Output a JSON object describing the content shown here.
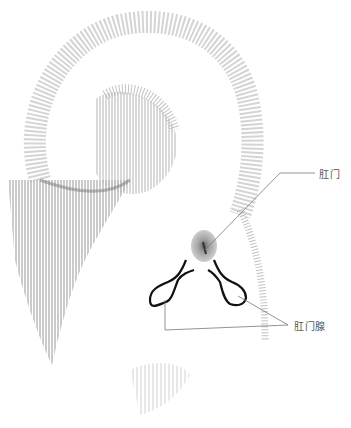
{
  "diagram": {
    "type": "anatomical-illustration",
    "colors": {
      "background": "#ffffff",
      "sketch_gray": "#9a9a9a",
      "dark_gray": "#6e6e6e",
      "outline": "#111111",
      "leader_line": "#777777",
      "label_text": "#555555"
    },
    "labels": [
      {
        "id": "anus",
        "text": "肛门"
      },
      {
        "id": "anal-glands",
        "text": "肛门腺"
      }
    ]
  }
}
